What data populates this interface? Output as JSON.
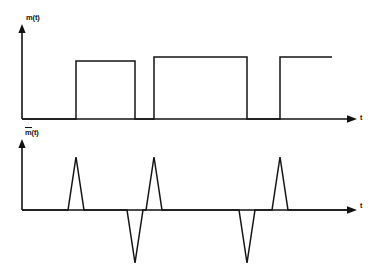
{
  "figure": {
    "background_color": "#ffffff",
    "line_color": "#141414",
    "axis_color": "#111111",
    "corner_mark": "",
    "top_plot": {
      "y_axis_label": "m(t)",
      "x_axis_label": "t",
      "axis_origin_x": 22,
      "baseline_y": 119,
      "y_axis_top": 26,
      "x_axis_end": 355
    },
    "bottom_plot": {
      "y_axis_label_base": "m",
      "y_axis_label_suffix": "(t)",
      "y_axis_label": "m̃(t)",
      "x_axis_label": "t",
      "axis_origin_x": 22,
      "baseline_y": 210,
      "y_axis_top": 140,
      "x_axis_end": 355
    }
  },
  "chart_data": {
    "type": "line",
    "xlabel": "t",
    "ylabel": "m(t) / m̃(t)",
    "grid": false,
    "legend": "none",
    "panels": [
      {
        "name": "top",
        "ylabel": "m(t)",
        "xlabel": "t",
        "description": "Rectangular pulse train: three positive rectangular pulses of unit amplitude on a zero baseline; the third pulse remains high to the right edge of the plot.",
        "baseline_value": 0,
        "pulse_amplitude": 1,
        "ylim": [
          0,
          1.2
        ],
        "xlim": [
          22,
          355
        ],
        "pulses": [
          {
            "index": 1,
            "rise_x": 76,
            "fall_x": 135,
            "amplitude": 1,
            "top_y": 61
          },
          {
            "index": 2,
            "rise_x": 154,
            "fall_x": 247,
            "amplitude": 1,
            "top_y": 57
          },
          {
            "index": 3,
            "rise_x": 280,
            "fall_x": 332,
            "amplitude": 1,
            "top_y": 57,
            "open_ended": true
          }
        ],
        "x": [
          22,
          76,
          76,
          135,
          135,
          154,
          154,
          247,
          247,
          280,
          280,
          332
        ],
        "y": [
          0,
          0,
          1,
          1,
          0,
          0,
          1,
          1,
          0,
          0,
          1,
          1
        ]
      },
      {
        "name": "bottom",
        "ylabel": "m̃(t)",
        "xlabel": "t",
        "description": "Impulse-like triangular spikes at each transition of m(t): upward spikes at rising edges, downward spikes at falling edges.",
        "baseline_value": 0,
        "ylim": [
          -1.0,
          1.0
        ],
        "xlim": [
          22,
          355
        ],
        "spikes": [
          {
            "index": 1,
            "center_x": 76,
            "direction": "up",
            "peak_y": 157,
            "amplitude": 1,
            "half_width": 8
          },
          {
            "index": 2,
            "center_x": 135,
            "direction": "down",
            "peak_y": 263,
            "amplitude": -1,
            "half_width": 8
          },
          {
            "index": 3,
            "center_x": 154,
            "direction": "up",
            "peak_y": 157,
            "amplitude": 1,
            "half_width": 8
          },
          {
            "index": 4,
            "center_x": 247,
            "direction": "down",
            "peak_y": 263,
            "amplitude": -1,
            "half_width": 8
          },
          {
            "index": 5,
            "center_x": 280,
            "direction": "up",
            "peak_y": 157,
            "amplitude": 1,
            "half_width": 8
          }
        ],
        "x": [
          22,
          68,
          76,
          84,
          127,
          135,
          143,
          146,
          154,
          162,
          239,
          247,
          255,
          272,
          280,
          288,
          355
        ],
        "y": [
          0,
          0,
          1,
          0,
          0,
          -1,
          0,
          0,
          1,
          0,
          0,
          -1,
          0,
          0,
          1,
          0,
          0
        ]
      }
    ]
  }
}
